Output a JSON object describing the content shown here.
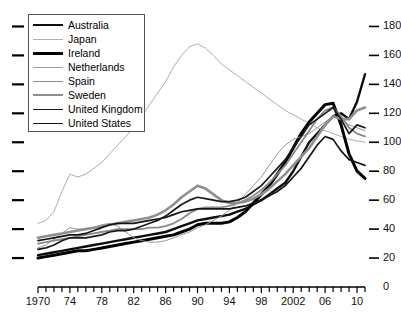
{
  "chart_data": {
    "type": "line",
    "title": "",
    "xlabel": "",
    "ylabel": "",
    "xlim": [
      1970,
      2011
    ],
    "ylim": [
      0,
      190
    ],
    "grid": false,
    "legend_position": "top-left",
    "y_ticks": [
      0,
      20,
      40,
      60,
      80,
      100,
      120,
      140,
      160,
      180
    ],
    "y_tick_labels": [
      "0",
      "20",
      "40",
      "60",
      "80",
      "100",
      "120",
      "140",
      "160",
      "180"
    ],
    "x_ticks": [
      1970,
      1974,
      1978,
      1982,
      1986,
      1990,
      1994,
      1998,
      2002,
      2006,
      2010
    ],
    "x_tick_labels": [
      "1970",
      "74",
      "78",
      "82",
      "86",
      "90",
      "94",
      "98",
      "2002",
      "06",
      "10"
    ],
    "x_minor_ticks_every": 1,
    "x": [
      1970,
      1971,
      1972,
      1973,
      1974,
      1975,
      1976,
      1977,
      1978,
      1979,
      1980,
      1981,
      1982,
      1983,
      1984,
      1985,
      1986,
      1987,
      1988,
      1989,
      1990,
      1991,
      1992,
      1993,
      1994,
      1995,
      1996,
      1997,
      1998,
      1999,
      2000,
      2001,
      2002,
      2003,
      2004,
      2005,
      2006,
      2007,
      2008,
      2009,
      2010,
      2011
    ],
    "series": [
      {
        "name": "Australia",
        "color": "#0d0d0d",
        "width": 2.4,
        "values": [
          22,
          23,
          24,
          25,
          26,
          27,
          28,
          29,
          30,
          31,
          32,
          33,
          34,
          35,
          36,
          37,
          38,
          40,
          42,
          44,
          46,
          47,
          48,
          49,
          50,
          52,
          54,
          57,
          60,
          64,
          68,
          72,
          80,
          90,
          100,
          106,
          112,
          118,
          120,
          116,
          128,
          147
        ]
      },
      {
        "name": "Japan",
        "color": "#aeaeae",
        "width": 1.0,
        "values": [
          44,
          46,
          52,
          66,
          78,
          76,
          78,
          82,
          86,
          92,
          98,
          104,
          110,
          118,
          126,
          134,
          142,
          152,
          160,
          166,
          168,
          165,
          160,
          154,
          150,
          146,
          142,
          138,
          134,
          130,
          126,
          122,
          119,
          116,
          113,
          110,
          108,
          106,
          104,
          102,
          101,
          100
        ]
      },
      {
        "name": "Ireland",
        "color": "#000000",
        "width": 3.0,
        "values": [
          20,
          21,
          22,
          23,
          24,
          25,
          25,
          26,
          27,
          28,
          29,
          30,
          31,
          32,
          33,
          34,
          35,
          36,
          38,
          40,
          43,
          44,
          44,
          44,
          45,
          48,
          52,
          58,
          64,
          70,
          78,
          86,
          96,
          106,
          114,
          120,
          126,
          127,
          112,
          92,
          80,
          75
        ]
      },
      {
        "name": "Netherlands",
        "color": "#999999",
        "width": 1.0,
        "values": [
          27,
          29,
          33,
          37,
          41,
          40,
          40,
          41,
          43,
          44,
          42,
          38,
          34,
          32,
          31,
          31,
          32,
          34,
          36,
          38,
          41,
          43,
          46,
          49,
          53,
          58,
          64,
          70,
          76,
          84,
          92,
          98,
          102,
          104,
          106,
          110,
          114,
          118,
          116,
          112,
          110,
          108
        ]
      },
      {
        "name": "Spain",
        "color": "#8a8a8a",
        "width": 1.8,
        "values": [
          30,
          31,
          32,
          33,
          34,
          35,
          36,
          37,
          38,
          39,
          40,
          40,
          40,
          40,
          41,
          41,
          42,
          44,
          47,
          51,
          54,
          55,
          55,
          55,
          56,
          58,
          60,
          63,
          67,
          72,
          78,
          84,
          92,
          100,
          108,
          116,
          122,
          124,
          118,
          110,
          106,
          104
        ]
      },
      {
        "name": "Sweden",
        "color": "#8f8f8f",
        "width": 2.6,
        "values": [
          34,
          35,
          36,
          37,
          38,
          39,
          40,
          41,
          42,
          43,
          44,
          45,
          46,
          47,
          48,
          50,
          53,
          57,
          62,
          66,
          70,
          68,
          64,
          60,
          58,
          58,
          59,
          61,
          64,
          68,
          73,
          78,
          84,
          90,
          96,
          104,
          112,
          118,
          116,
          116,
          122,
          124
        ]
      },
      {
        "name": "United Kingdom",
        "color": "#1a1a1a",
        "width": 1.7,
        "values": [
          26,
          27,
          29,
          32,
          34,
          34,
          34,
          35,
          36,
          38,
          39,
          39,
          40,
          42,
          44,
          46,
          49,
          53,
          57,
          60,
          62,
          61,
          60,
          59,
          59,
          60,
          62,
          66,
          70,
          76,
          82,
          88,
          96,
          104,
          112,
          116,
          120,
          124,
          116,
          106,
          112,
          110
        ]
      },
      {
        "name": "United States",
        "color": "#141414",
        "width": 1.7,
        "values": [
          32,
          33,
          34,
          35,
          36,
          36,
          37,
          39,
          41,
          43,
          44,
          44,
          44,
          45,
          46,
          47,
          48,
          50,
          52,
          53,
          54,
          54,
          54,
          54,
          54,
          55,
          56,
          58,
          60,
          63,
          66,
          70,
          76,
          82,
          90,
          98,
          104,
          102,
          94,
          88,
          86,
          84
        ]
      }
    ]
  }
}
